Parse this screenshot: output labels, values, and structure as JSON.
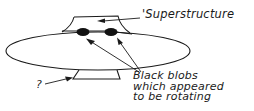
{
  "diagram": {
    "type": "sketch",
    "labels": {
      "superstructure": "'Superstructure",
      "blobs_line1": "Black blobs",
      "blobs_line2": "which appeared",
      "blobs_line3": "to be rotating",
      "question": "?"
    },
    "colors": {
      "ink": "#1a1a1a",
      "background": "#ffffff"
    }
  }
}
